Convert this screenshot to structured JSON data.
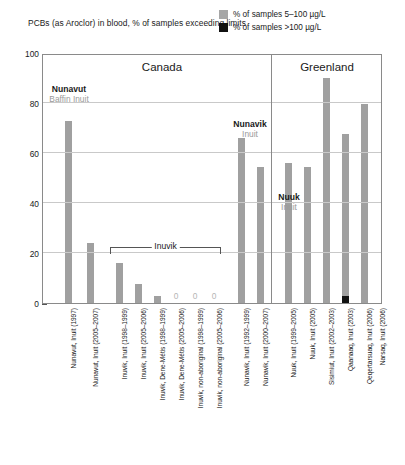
{
  "chart_data": {
    "type": "bar",
    "title": "PCBs (as Aroclor) in blood, % of samples exceeding limits",
    "xlabel": "",
    "ylabel": "",
    "ylim": [
      0,
      100
    ],
    "yticks": [
      0,
      20,
      40,
      60,
      80,
      100
    ],
    "grid": true,
    "legend_position": "top-right",
    "legend": [
      {
        "key": "light",
        "label": "% of samples 5–100 µg/L",
        "color": "#a6a6a6"
      },
      {
        "key": "dark",
        "label": "% of samples >100 µg/L",
        "color": "#111111"
      }
    ],
    "regions": [
      {
        "name": "Canada",
        "label": "Canada"
      },
      {
        "name": "Greenland",
        "label": "Greenland"
      }
    ],
    "annotations": [
      {
        "name": "nunavut",
        "line1": "Nunavut",
        "line2": "Baffin Inuit"
      },
      {
        "name": "inuvik-bracket",
        "line1": "Inuvik",
        "line2": ""
      },
      {
        "name": "nunavik",
        "line1": "Nunavik",
        "line2": "Inuit"
      },
      {
        "name": "nuuk",
        "line1": "Nuuk",
        "line2": "Inuit"
      }
    ],
    "categories": [
      "Nunavut, Inuit (1997)",
      "Nunavut, Inuit (2005–2007)",
      "Inuvik, Inuit (1998–1999)",
      "Inuvik, Inuit (2005–2006)",
      "Inuvik, Dene-Métis (1998–1999)",
      "Inuvik, Dene-Métis (2005–2006)",
      "Inuvik, non-aboriginal (1998–1999)",
      "Inuvik, non-aboriginal (2005–2006)",
      "Nunavik, Inuit (1992–1999)",
      "Nunavik, Inuit (2000–2007)",
      "Nuuk, Inuit (1999–2005)",
      "Nuuk, Inuit (2005)",
      "Sisimiut, Inuit (2002–2003)",
      "Qaanaaq, Inuit (2003)",
      "Qeqertarsuaq, Inuit (2006)",
      "Narsaq, Inuit (2006)"
    ],
    "series": [
      {
        "name": "% of samples 5–100 µg/L",
        "color": "#a0a0a0",
        "values": [
          73,
          24,
          16,
          7.5,
          3,
          0,
          0,
          0,
          66,
          54.5,
          56,
          54.5,
          90,
          67.5,
          79.5,
          0
        ]
      },
      {
        "name": "% of samples >100 µg/L",
        "color": "#111111",
        "values": [
          0,
          0,
          0,
          0,
          0,
          0,
          0,
          0,
          0,
          0,
          0,
          0,
          0,
          3,
          0,
          0
        ]
      }
    ],
    "zero_labels": [
      "0",
      "0",
      "0"
    ]
  }
}
